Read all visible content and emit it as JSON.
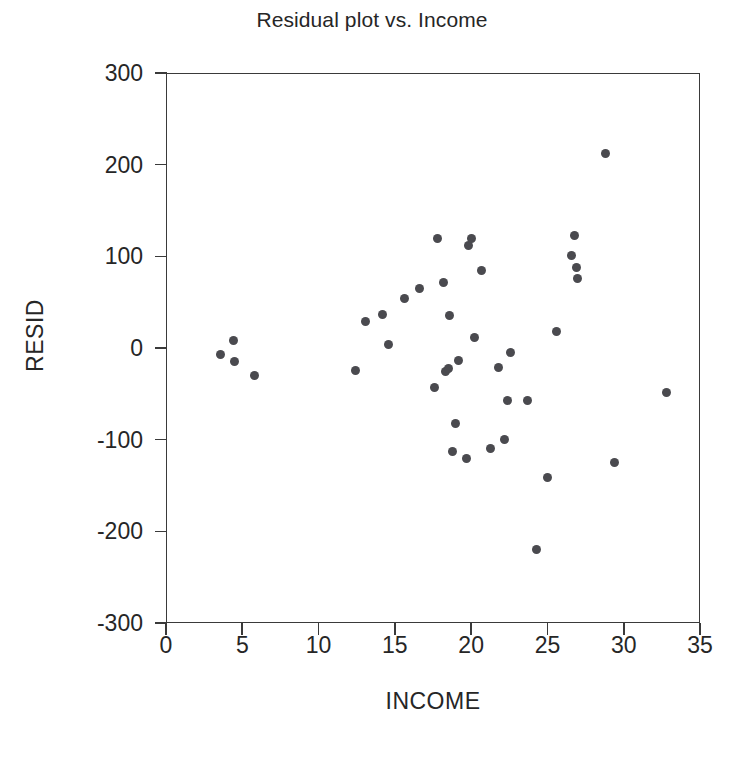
{
  "chart_data": {
    "type": "scatter",
    "title": "Residual plot vs. Income",
    "xlabel": "INCOME",
    "ylabel": "RESID",
    "xlim": [
      0,
      35
    ],
    "ylim": [
      -300,
      300
    ],
    "xticks": [
      0,
      5,
      10,
      15,
      20,
      25,
      30,
      35
    ],
    "yticks": [
      300,
      200,
      100,
      0,
      -100,
      -200,
      -300
    ],
    "grid": false,
    "legend": null,
    "marker_color": "#4a4a4f",
    "axis_color": "#3a3a3a",
    "points": [
      {
        "x": 3.6,
        "y": -7
      },
      {
        "x": 4.4,
        "y": 8
      },
      {
        "x": 4.5,
        "y": -15
      },
      {
        "x": 5.8,
        "y": -30
      },
      {
        "x": 12.4,
        "y": -24
      },
      {
        "x": 13.1,
        "y": 29
      },
      {
        "x": 14.2,
        "y": 37
      },
      {
        "x": 14.6,
        "y": 4
      },
      {
        "x": 15.6,
        "y": 54
      },
      {
        "x": 16.6,
        "y": 65
      },
      {
        "x": 17.6,
        "y": -43
      },
      {
        "x": 17.8,
        "y": 120
      },
      {
        "x": 18.2,
        "y": 71
      },
      {
        "x": 18.3,
        "y": -26
      },
      {
        "x": 18.5,
        "y": -22
      },
      {
        "x": 18.6,
        "y": 35
      },
      {
        "x": 18.8,
        "y": -113
      },
      {
        "x": 19.0,
        "y": -82
      },
      {
        "x": 19.2,
        "y": -14
      },
      {
        "x": 19.7,
        "y": -120
      },
      {
        "x": 19.8,
        "y": 112
      },
      {
        "x": 20.0,
        "y": 120
      },
      {
        "x": 20.2,
        "y": 11
      },
      {
        "x": 20.7,
        "y": 85
      },
      {
        "x": 21.3,
        "y": -110
      },
      {
        "x": 21.8,
        "y": -21
      },
      {
        "x": 22.2,
        "y": -100
      },
      {
        "x": 22.4,
        "y": -57
      },
      {
        "x": 22.6,
        "y": -5
      },
      {
        "x": 23.7,
        "y": -57
      },
      {
        "x": 24.3,
        "y": -220
      },
      {
        "x": 25.0,
        "y": -141
      },
      {
        "x": 25.6,
        "y": 18
      },
      {
        "x": 26.6,
        "y": 101
      },
      {
        "x": 26.8,
        "y": 123
      },
      {
        "x": 26.9,
        "y": 88
      },
      {
        "x": 27.0,
        "y": 76
      },
      {
        "x": 28.8,
        "y": 212
      },
      {
        "x": 29.4,
        "y": -125
      },
      {
        "x": 32.8,
        "y": -48
      }
    ]
  }
}
